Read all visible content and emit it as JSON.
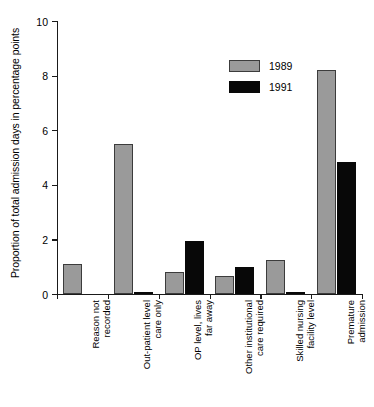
{
  "chart_data": {
    "type": "bar",
    "title": "",
    "xlabel": "",
    "ylabel": "Proportion of total admission days in percentage points",
    "ylim": [
      0,
      10
    ],
    "yticks": [
      0,
      2,
      4,
      6,
      8,
      10
    ],
    "grid": false,
    "legend_position": "top-right",
    "categories": [
      "Reason not recorded",
      "Out-patient level care only",
      "OP level, lives far away",
      "Other institutional care required",
      "Skilled nursing facility level",
      "Premature admission"
    ],
    "category_lines": [
      [
        "Reason not",
        "recorded"
      ],
      [
        "Out-patient level",
        "care only"
      ],
      [
        "OP level, lives",
        "far away"
      ],
      [
        "Other institutional",
        "care required"
      ],
      [
        "Skilled nursing",
        "facility level"
      ],
      [
        "Premature",
        "admission"
      ]
    ],
    "series": [
      {
        "name": "1989",
        "color": "#9a9a9a",
        "values": [
          1.1,
          5.5,
          0.8,
          0.65,
          1.25,
          8.2
        ]
      },
      {
        "name": "1991",
        "color": "#080808",
        "values": [
          0.0,
          0.08,
          1.95,
          1.0,
          0.08,
          4.85
        ]
      }
    ]
  },
  "legend": {
    "entries": [
      {
        "label": "1989"
      },
      {
        "label": "1991"
      }
    ]
  }
}
